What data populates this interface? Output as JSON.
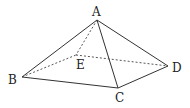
{
  "diagram": {
    "type": "pyramid",
    "vertices": {
      "A": {
        "label": "A",
        "x": 97,
        "y": 20,
        "lx": 92,
        "ly": 16
      },
      "B": {
        "label": "B",
        "x": 22,
        "y": 77,
        "lx": 8,
        "ly": 84
      },
      "C": {
        "label": "C",
        "x": 118,
        "y": 88,
        "lx": 115,
        "ly": 102
      },
      "D": {
        "label": "D",
        "x": 168,
        "y": 66,
        "lx": 172,
        "ly": 72
      },
      "E": {
        "label": "E",
        "x": 76,
        "y": 55,
        "lx": 76,
        "ly": 69
      }
    },
    "solid_edges": [
      [
        "A",
        "B"
      ],
      [
        "A",
        "C"
      ],
      [
        "A",
        "D"
      ],
      [
        "B",
        "C"
      ],
      [
        "C",
        "D"
      ]
    ],
    "dashed_edges": [
      [
        "A",
        "E"
      ],
      [
        "B",
        "E"
      ],
      [
        "E",
        "D"
      ]
    ],
    "stroke_color": "#333333"
  }
}
